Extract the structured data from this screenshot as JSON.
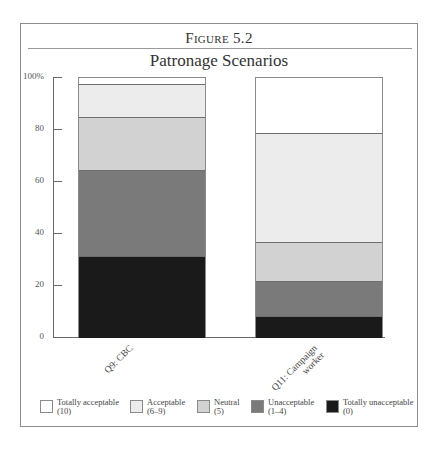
{
  "figure": {
    "label": "Figure 5.2",
    "title": "Patronage Scenarios"
  },
  "colors": {
    "totally_acceptable": "#ffffff",
    "acceptable": "#ececec",
    "neutral": "#d2d2d2",
    "unacceptable": "#7a7a7a",
    "totally_unacceptable": "#1a1a1a"
  },
  "y_ticks": [
    "100%",
    "80",
    "60",
    "40",
    "20",
    "0"
  ],
  "legend": [
    {
      "label": "Totally acceptable",
      "sub": "(10)"
    },
    {
      "label": "Acceptable",
      "sub": "(6–9)"
    },
    {
      "label": "Neutral",
      "sub": "(5)"
    },
    {
      "label": "Unacceptable",
      "sub": "(1–4)"
    },
    {
      "label": "Totally unacceptable",
      "sub": "(0)"
    }
  ],
  "categories": [
    {
      "line1": "Q9: CBC",
      "line2": ""
    },
    {
      "line1": "Q11: Campaign",
      "line2": "worker"
    }
  ],
  "chart_data": {
    "type": "bar",
    "stacked": true,
    "xlabel": "",
    "ylabel": "",
    "ylim": [
      0,
      100
    ],
    "yticks": [
      0,
      20,
      40,
      60,
      80,
      100
    ],
    "ytick_labels": [
      "0",
      "20",
      "40",
      "60",
      "80",
      "100%"
    ],
    "categories": [
      "Q9: CBC",
      "Q11: Campaign worker"
    ],
    "series": [
      {
        "name": "Totally unacceptable (0)",
        "values": [
          31.5,
          8.5
        ]
      },
      {
        "name": "Unacceptable (1–4)",
        "values": [
          33.0,
          13.5
        ]
      },
      {
        "name": "Neutral (5)",
        "values": [
          20.5,
          15.0
        ]
      },
      {
        "name": "Acceptable (6–9)",
        "values": [
          12.7,
          42.0
        ]
      },
      {
        "name": "Totally acceptable (10)",
        "values": [
          2.3,
          21.0
        ]
      }
    ],
    "grid": false,
    "legend_position": "bottom"
  }
}
